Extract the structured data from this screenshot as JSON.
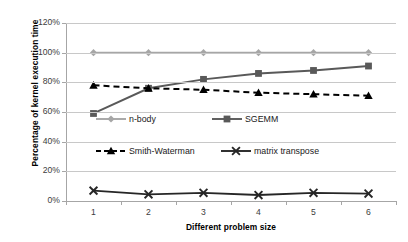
{
  "chart_data": {
    "type": "line",
    "title": "",
    "xlabel": "Different problem size",
    "ylabel": "Percentage of kernel execution time",
    "categories": [
      "1",
      "2",
      "3",
      "4",
      "5",
      "6"
    ],
    "x": [
      1,
      2,
      3,
      4,
      5,
      6
    ],
    "ylim": [
      0,
      120
    ],
    "ytick_labels": [
      "0%",
      "20%",
      "40%",
      "60%",
      "80%",
      "100%",
      "120%"
    ],
    "ytick_values": [
      0,
      20,
      40,
      60,
      80,
      100,
      120
    ],
    "grid": "horizontal",
    "legend_position": "inside-upper-middle",
    "series": [
      {
        "name": "n-body",
        "values": [
          100,
          100,
          100,
          100,
          100,
          100
        ],
        "color": "#a6a6a6",
        "marker": "diamond",
        "linestyle": "solid"
      },
      {
        "name": "SGEMM",
        "values": [
          59,
          76,
          82,
          86,
          88,
          91
        ],
        "color": "#595959",
        "marker": "square",
        "linestyle": "solid"
      },
      {
        "name": "Smith-Waterman",
        "values": [
          78,
          76,
          75,
          73,
          72,
          71
        ],
        "color": "#000000",
        "marker": "triangle",
        "linestyle": "dashed"
      },
      {
        "name": "matrix transpose",
        "values": [
          7,
          4.5,
          5.5,
          4,
          5.5,
          5
        ],
        "color": "#262626",
        "marker": "cross",
        "linestyle": "solid"
      }
    ]
  },
  "axes": {
    "y_title": "Percentage of kernel execution time",
    "x_title": "Different problem size"
  },
  "legend": {
    "items": [
      {
        "label": "n-body"
      },
      {
        "label": "SGEMM"
      },
      {
        "label": "Smith-Waterman"
      },
      {
        "label": "matrix transpose"
      }
    ]
  }
}
